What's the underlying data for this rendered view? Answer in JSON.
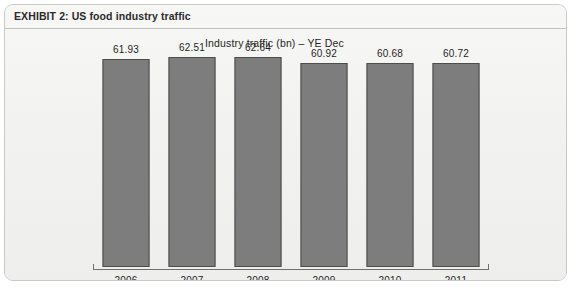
{
  "exhibit": {
    "title": "EXHIBIT 2:  US food industry traffic"
  },
  "chart_data": {
    "type": "bar",
    "title": "Industry traffic (bn) – YE Dec",
    "xlabel": "",
    "ylabel": "",
    "categories": [
      "2006",
      "2007",
      "2008",
      "2009",
      "2010",
      "2011"
    ],
    "values": [
      61.93,
      62.51,
      62.64,
      60.92,
      60.68,
      60.72
    ],
    "value_labels": [
      "61.93",
      "62.51",
      "62.64",
      "60.92",
      "60.68",
      "60.72"
    ],
    "ylim": [
      0,
      63.2
    ],
    "grid": false,
    "legend": null,
    "series": [
      {
        "name": "Industry traffic (bn)",
        "values": [
          61.93,
          62.51,
          62.64,
          60.92,
          60.68,
          60.72
        ]
      }
    ],
    "colors": {
      "bar_fill": "#7d7d7d",
      "bar_border": "#4d4d4d",
      "axis": "#6f6f6f",
      "text": "#1f1f1f",
      "panel_background": "#f4f4f3",
      "panel_border": "#c9c9c7"
    }
  }
}
